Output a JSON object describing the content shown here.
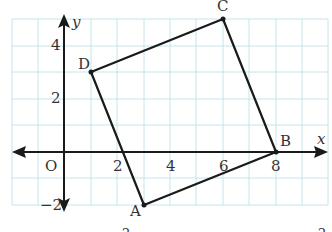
{
  "diagram": {
    "type": "coordinate-plane-quadrilateral",
    "grid_color": "#bfe3ea",
    "line_color": "#1a1a1a",
    "axes": {
      "x_label": "x",
      "y_label": "y",
      "origin_label": "O",
      "x_ticks": [
        {
          "value": 2,
          "label": "2"
        },
        {
          "value": 4,
          "label": "4"
        },
        {
          "value": 6,
          "label": "6"
        },
        {
          "value": 8,
          "label": "8"
        }
      ],
      "y_ticks": [
        {
          "value": 4,
          "label": "4"
        },
        {
          "value": 2,
          "label": "2"
        },
        {
          "value": -2,
          "label": "−2"
        }
      ],
      "x_range": [
        -2,
        10
      ],
      "y_range": [
        -2,
        5
      ]
    },
    "points": [
      {
        "name": "A",
        "x": 3,
        "y": -2
      },
      {
        "name": "B",
        "x": 8,
        "y": 0
      },
      {
        "name": "C",
        "x": 6,
        "y": 5
      },
      {
        "name": "D",
        "x": 1,
        "y": 3
      }
    ],
    "polygon": [
      "A",
      "B",
      "C",
      "D"
    ],
    "footer_fragments": [
      "2",
      "2"
    ]
  }
}
